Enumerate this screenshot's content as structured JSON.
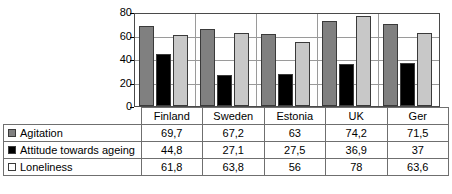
{
  "chart_data": {
    "type": "bar",
    "title": "",
    "xlabel": "",
    "ylabel": "",
    "ylim": [
      0,
      80
    ],
    "yticks": [
      0,
      20,
      40,
      60,
      80
    ],
    "grid": true,
    "legend_position": "table-left",
    "categories": [
      "Finland",
      "Sweden",
      "Estonia",
      "UK",
      "Ger"
    ],
    "series": [
      {
        "name": "Agitation",
        "color": "#808080",
        "swatch": "medium-gray",
        "values": [
          69.7,
          67.2,
          63,
          74.2,
          71.5
        ],
        "labels": [
          "69,7",
          "67,2",
          "63",
          "74,2",
          "71,5"
        ]
      },
      {
        "name": "Attitude towards ageing",
        "color": "#000000",
        "swatch": "black",
        "values": [
          44.8,
          27.1,
          27.5,
          36.9,
          37
        ],
        "labels": [
          "44,8",
          "27,1",
          "27,5",
          "36,9",
          "37"
        ]
      },
      {
        "name": "Loneliness",
        "color": "#c8c8c8",
        "swatch": "light-gray",
        "values": [
          61.8,
          63.8,
          56,
          78,
          63.6
        ],
        "labels": [
          "61,8",
          "63,8",
          "56",
          "78",
          "63,6"
        ]
      }
    ]
  }
}
